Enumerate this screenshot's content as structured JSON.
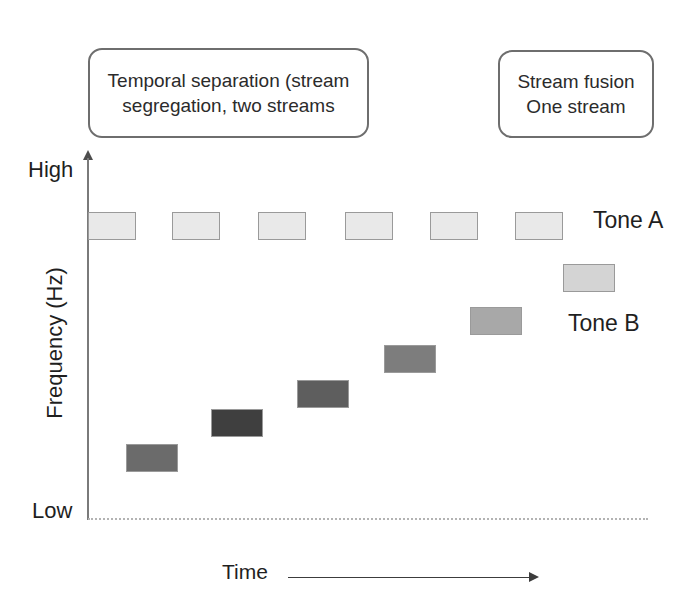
{
  "figure": {
    "title_callouts": [
      {
        "id": "temporal-separation",
        "lines": [
          "Temporal separation (stream",
          "segregation, two streams"
        ]
      },
      {
        "id": "stream-fusion",
        "lines": [
          "Stream fusion",
          "One stream"
        ]
      }
    ],
    "axes": {
      "y_label": "Frequency (Hz)",
      "y_max_label": "High",
      "y_min_label": "Low",
      "x_label": "Time"
    },
    "legend": {
      "tone_a": "Tone A",
      "tone_b": "Tone B"
    }
  },
  "chart_data": {
    "type": "bar",
    "title": "",
    "xlabel": "Time",
    "ylabel": "Frequency (Hz)",
    "ylim_labels": [
      "Low",
      "High"
    ],
    "grid": false,
    "legend_position": "right",
    "series": [
      {
        "name": "Tone A",
        "color": "#e9e9e9",
        "bars": [
          {
            "index": 1,
            "x": 88,
            "y": 212,
            "w": 48,
            "h": 28,
            "color": "#e9e9e9"
          },
          {
            "index": 2,
            "x": 172,
            "y": 212,
            "w": 48,
            "h": 28,
            "color": "#e9e9e9"
          },
          {
            "index": 3,
            "x": 258,
            "y": 212,
            "w": 48,
            "h": 28,
            "color": "#e9e9e9"
          },
          {
            "index": 4,
            "x": 345,
            "y": 212,
            "w": 48,
            "h": 28,
            "color": "#e9e9e9"
          },
          {
            "index": 5,
            "x": 430,
            "y": 212,
            "w": 48,
            "h": 28,
            "color": "#e9e9e9"
          },
          {
            "index": 6,
            "x": 515,
            "y": 212,
            "w": 48,
            "h": 28,
            "color": "#e9e9e9"
          }
        ]
      },
      {
        "name": "Tone B",
        "color": "#6e6e6e",
        "bars": [
          {
            "index": 1,
            "x": 126,
            "y": 444,
            "w": 52,
            "h": 28,
            "color": "#6b6b6b"
          },
          {
            "index": 2,
            "x": 211,
            "y": 409,
            "w": 52,
            "h": 28,
            "color": "#3f3f3f"
          },
          {
            "index": 3,
            "x": 297,
            "y": 380,
            "w": 52,
            "h": 28,
            "color": "#5e5e5e"
          },
          {
            "index": 4,
            "x": 384,
            "y": 345,
            "w": 52,
            "h": 28,
            "color": "#7d7d7d"
          },
          {
            "index": 5,
            "x": 470,
            "y": 307,
            "w": 52,
            "h": 28,
            "color": "#a8a8a8"
          },
          {
            "index": 6,
            "x": 563,
            "y": 264,
            "w": 52,
            "h": 28,
            "color": "#d4d4d4"
          }
        ]
      }
    ]
  }
}
